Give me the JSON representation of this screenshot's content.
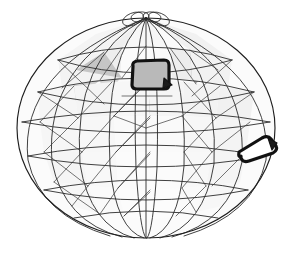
{
  "figure": {
    "background_color": "#ffffff",
    "canvas": {
      "width": 292,
      "height": 259
    }
  },
  "sphere": {
    "center_x": 146,
    "center_y": 128,
    "radius_x": 129,
    "radius_y": 110,
    "pole_x": 146,
    "pole_y": 18,
    "outline_color": "#1e1e1e",
    "grid_color": "#2b2b2b"
  },
  "shading": {
    "face_light": "#f2f2f2",
    "face_pale": "#e6e6e6",
    "face_mid": "#cfcfcf",
    "face_gray": "#b4b4b4",
    "face_dark": "#a2a2a2",
    "face_white": "#fbfbfb"
  },
  "grid": {
    "latitude_count": 7,
    "longitude_count": 12,
    "latitude_label": "latitude rings",
    "longitude_label": "meridian arcs",
    "diagonal_label": "triangulation diagonals"
  },
  "faces": [
    {
      "id": "cap-left-pale",
      "points": "146,18 96,34 58,60 104,52",
      "fill": "#f4f4f4"
    },
    {
      "id": "cap-midleft",
      "points": "146,18 104,52 122,48",
      "fill": "#efefef"
    },
    {
      "id": "cap-right-pale",
      "points": "146,18 190,50 232,60 196,34",
      "fill": "#f1f1f1"
    },
    {
      "id": "cap-top-mid",
      "points": "146,18 122,48 146,46 170,48",
      "fill": "#f7f7f7"
    },
    {
      "id": "band-l1",
      "points": "58,60 104,52 100,80 62,88",
      "fill": "#f3f3f3"
    },
    {
      "id": "band-l2",
      "points": "104,52 122,48 120,78 100,80",
      "fill": "#eeeeee"
    },
    {
      "id": "tri-shade-left",
      "points": "62,88 100,80 72,104",
      "fill": "#cccccc"
    },
    {
      "id": "tri-shade-left2",
      "points": "100,80 120,78 104,104",
      "fill": "#d6d6d6"
    },
    {
      "id": "tri-big-left",
      "points": "104,52 122,78 76,70",
      "fill": "#c6c6c6"
    },
    {
      "id": "tri-big-right",
      "points": "190,50 172,78 218,70",
      "fill": "#bdbdbd"
    },
    {
      "id": "tri-mid-right",
      "points": "170,48 196,84 214,60",
      "fill": "#b0b0b0"
    },
    {
      "id": "tri-down-center",
      "points": "122,96 172,96 147,128",
      "fill": "#a4a4a4"
    },
    {
      "id": "band-r1",
      "points": "190,50 232,60 228,88 192,80",
      "fill": "#f2f2f2"
    },
    {
      "id": "band-r2",
      "points": "170,48 190,50 192,80 172,78",
      "fill": "#ededed"
    },
    {
      "id": "mid-left-a",
      "points": "38,92 74,86 78,118 40,122",
      "fill": "#f6f6f6"
    },
    {
      "id": "mid-left-b",
      "points": "74,86 112,82 114,116 78,118",
      "fill": "#f4f4f4"
    },
    {
      "id": "mid-center",
      "points": "112,82 148,80 150,116 114,116",
      "fill": "#f7f7f7"
    },
    {
      "id": "mid-right-b",
      "points": "148,80 184,82 182,116 150,116",
      "fill": "#f5f5f5"
    },
    {
      "id": "mid-right-a",
      "points": "184,82 220,86 216,118 182,116",
      "fill": "#f3f3f3"
    },
    {
      "id": "mid-far-right",
      "points": "220,86 254,92 250,122 216,118",
      "fill": "#f1f1f1"
    },
    {
      "id": "low-left-a",
      "points": "40,122 78,118 82,152 44,152",
      "fill": "#f6f6f6"
    },
    {
      "id": "low-left-b",
      "points": "78,118 114,116 116,152 82,152",
      "fill": "#f7f7f7"
    },
    {
      "id": "low-center",
      "points": "114,116 150,116 150,152 116,152",
      "fill": "#fafafa"
    },
    {
      "id": "low-right-b",
      "points": "150,116 182,116 184,152 150,152",
      "fill": "#fafafa"
    },
    {
      "id": "low-right-a",
      "points": "182,116 216,118 212,152 184,152",
      "fill": "#f7f7f7"
    },
    {
      "id": "low-far-right",
      "points": "216,118 250,122 246,152 212,152",
      "fill": "#f4f4f4"
    },
    {
      "id": "bot-left-a",
      "points": "44,152 82,152 88,186 54,182",
      "fill": "#f5f5f5"
    },
    {
      "id": "bot-left-b",
      "points": "82,152 116,152 118,188 88,186",
      "fill": "#f8f8f8"
    },
    {
      "id": "bot-center",
      "points": "116,152 150,152 150,190 118,188",
      "fill": "#fbfbfb"
    },
    {
      "id": "bot-right-b",
      "points": "150,152 184,152 182,188 150,190",
      "fill": "#fbfbfb"
    },
    {
      "id": "bot-right-a",
      "points": "184,152 212,152 206,186 182,188",
      "fill": "#f8f8f8"
    },
    {
      "id": "bot-far-right",
      "points": "212,152 246,152 240,182 206,186",
      "fill": "#f5f5f5"
    },
    {
      "id": "base-left",
      "points": "54,182 88,186 100,214 72,206",
      "fill": "#f7f7f7"
    },
    {
      "id": "base-midleft",
      "points": "88,186 118,188 124,216 100,214",
      "fill": "#fafafa"
    },
    {
      "id": "base-center",
      "points": "118,188 150,190 150,220 124,216",
      "fill": "#fcfcfc"
    },
    {
      "id": "base-midright",
      "points": "150,190 182,188 176,216 150,220",
      "fill": "#fcfcfc"
    },
    {
      "id": "base-right",
      "points": "182,188 206,186 196,212 176,216",
      "fill": "#fafafa"
    },
    {
      "id": "base-farright",
      "points": "206,186 240,182 222,206 196,212",
      "fill": "#f7f7f7"
    }
  ],
  "latitudes": [
    {
      "id": "lat-1",
      "d": "M 58,60 Q 146,34 232,60"
    },
    {
      "id": "lat-1b",
      "d": "M 58,60 Q 146,86 232,60"
    },
    {
      "id": "lat-2",
      "d": "M 38,92 Q 146,64 254,92"
    },
    {
      "id": "lat-2b",
      "d": "M 38,92 Q 146,118 254,92"
    },
    {
      "id": "lat-3",
      "d": "M 22,122 Q 146,100 270,122"
    },
    {
      "id": "lat-4",
      "d": "M 22,122 Q 146,144 270,122"
    },
    {
      "id": "lat-5",
      "d": "M 28,156 Q 146,134 264,156"
    },
    {
      "id": "lat-6",
      "d": "M 28,156 Q 146,178 264,156"
    },
    {
      "id": "lat-7",
      "d": "M 44,190 Q 146,170 248,190"
    },
    {
      "id": "lat-8",
      "d": "M 44,190 Q 146,210 248,190"
    },
    {
      "id": "lat-9",
      "d": "M 74,218 Q 146,204 218,218"
    }
  ],
  "longitudes": [
    {
      "id": "lon-1",
      "d": "M 146,18 Q 18,70 28,160 Q 40,215 110,236"
    },
    {
      "id": "lon-2",
      "d": "M 146,18 Q 44,62 52,162 Q 64,222 122,237"
    },
    {
      "id": "lon-3",
      "d": "M 146,18 Q 72,58 80,164 Q 90,226 134,238"
    },
    {
      "id": "lon-4",
      "d": "M 146,18 Q 104,54 110,166 Q 116,230 144,238"
    },
    {
      "id": "lon-5",
      "d": "M 146,18 Q 132,50 136,168 Q 140,232 146,238"
    },
    {
      "id": "lon-6",
      "d": "M 146,18 L 146,238"
    },
    {
      "id": "lon-7",
      "d": "M 146,18 Q 160,50 157,168 Q 153,232 147,238"
    },
    {
      "id": "lon-8",
      "d": "M 146,18 Q 188,54 184,166 Q 178,230 150,238"
    },
    {
      "id": "lon-9",
      "d": "M 146,18 Q 220,58 214,164 Q 204,226 160,238"
    },
    {
      "id": "lon-10",
      "d": "M 146,18 Q 248,62 242,162 Q 230,222 172,237"
    },
    {
      "id": "lon-11",
      "d": "M 146,18 Q 274,70 266,160 Q 254,215 184,236"
    }
  ],
  "diagonals": [
    {
      "id": "diag-1",
      "d": "M 58,60 L 104,104"
    },
    {
      "id": "diag-2",
      "d": "M 104,52 L 62,88"
    },
    {
      "id": "diag-3",
      "d": "M 122,48 L 100,80"
    },
    {
      "id": "diag-4",
      "d": "M 146,46 L 122,78"
    },
    {
      "id": "diag-5",
      "d": "M 170,48 L 196,84"
    },
    {
      "id": "diag-6",
      "d": "M 190,50 L 218,70"
    },
    {
      "id": "diag-7",
      "d": "M 232,60 L 192,96"
    },
    {
      "id": "diag-8",
      "d": "M 38,92 L 78,118"
    },
    {
      "id": "diag-9",
      "d": "M 74,86 L 40,122"
    },
    {
      "id": "diag-10",
      "d": "M 112,82 L 78,118"
    },
    {
      "id": "diag-11",
      "d": "M 148,80 L 114,116"
    },
    {
      "id": "diag-12",
      "d": "M 114,116 L 150,80"
    },
    {
      "id": "diag-13",
      "d": "M 184,82 L 216,118"
    },
    {
      "id": "diag-14",
      "d": "M 220,86 L 182,116"
    },
    {
      "id": "diag-15",
      "d": "M 254,92 L 216,118"
    },
    {
      "id": "diag-16",
      "d": "M 40,122 L 82,152"
    },
    {
      "id": "diag-17",
      "d": "M 78,118 L 44,152"
    },
    {
      "id": "diag-18",
      "d": "M 114,116 L 82,152"
    },
    {
      "id": "diag-19",
      "d": "M 150,116 L 116,152"
    },
    {
      "id": "diag-20",
      "d": "M 116,152 L 150,118"
    },
    {
      "id": "diag-21",
      "d": "M 182,116 L 212,152"
    },
    {
      "id": "diag-22",
      "d": "M 216,118 L 184,152"
    },
    {
      "id": "diag-23",
      "d": "M 250,122 L 212,152"
    },
    {
      "id": "diag-24",
      "d": "M 44,152 L 88,186"
    },
    {
      "id": "diag-25",
      "d": "M 82,152 L 54,182"
    },
    {
      "id": "diag-26",
      "d": "M 116,152 L 88,186"
    },
    {
      "id": "diag-27",
      "d": "M 150,152 L 118,188"
    },
    {
      "id": "diag-28",
      "d": "M 118,188 L 150,154"
    },
    {
      "id": "diag-29",
      "d": "M 184,152 L 206,186"
    },
    {
      "id": "diag-30",
      "d": "M 212,152 L 182,188"
    },
    {
      "id": "diag-31",
      "d": "M 246,152 L 212,186"
    },
    {
      "id": "diag-32",
      "d": "M 54,182 L 100,214"
    },
    {
      "id": "diag-33",
      "d": "M 88,186 L 72,206"
    },
    {
      "id": "diag-34",
      "d": "M 118,188 L 100,214"
    },
    {
      "id": "diag-35",
      "d": "M 150,190 L 124,216"
    },
    {
      "id": "diag-36",
      "d": "M 124,216 L 150,192"
    },
    {
      "id": "diag-37",
      "d": "M 182,188 L 196,212"
    },
    {
      "id": "diag-38",
      "d": "M 206,186 L 176,216"
    },
    {
      "id": "diag-39",
      "d": "M 146,128 L 114,116"
    },
    {
      "id": "diag-40",
      "d": "M 146,128 L 182,116"
    },
    {
      "id": "diag-41",
      "d": "M 122,96 L 172,96"
    }
  ],
  "pole_loops": [
    {
      "id": "loop-left",
      "cx": 133,
      "cy": 19,
      "rx": 11,
      "ry": 6,
      "rot": -22
    },
    {
      "id": "loop-midleft",
      "cx": 140,
      "cy": 17,
      "rx": 9,
      "ry": 5,
      "rot": -8
    },
    {
      "id": "loop-midright",
      "cx": 152,
      "cy": 17,
      "rx": 9,
      "ry": 5,
      "rot": 8
    },
    {
      "id": "loop-right",
      "cx": 159,
      "cy": 19,
      "rx": 11,
      "ry": 6,
      "rot": 22
    }
  ],
  "patches": [
    {
      "id": "patch-upper",
      "label": "upper highlighted region",
      "outline": "M 133,66 Q 132,62 137,61 L 164,60 Q 169,60 169,65 L 169,85 Q 169,89 164,89 L 137,89 Q 132,89 132,85 Z",
      "fill": "#b9b9b9",
      "stroke": "#111111",
      "tail": "M 164,78 L 172,85 L 163,88 Z"
    },
    {
      "id": "patch-right",
      "label": "right-limb highlighted region",
      "outline": "M 241,156 Q 238,158 239,152 L 262,138 Q 268,135 271,139 L 276,146 Q 278,150 273,153 L 249,161 Q 243,163 241,158 Z",
      "fill": "#ffffff",
      "stroke": "#111111",
      "tail": "M 268,138 L 277,143 L 272,150 Z"
    }
  ]
}
